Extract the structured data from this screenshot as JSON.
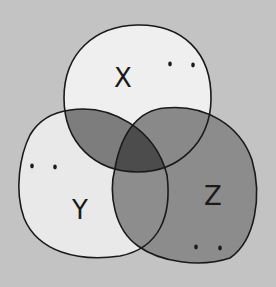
{
  "diagram": {
    "type": "venn",
    "sets": [
      {
        "id": "X",
        "label": "X",
        "region_color": "#efefef"
      },
      {
        "id": "Y",
        "label": "Y",
        "region_color": "#e9e9e9"
      },
      {
        "id": "Z",
        "label": "Z",
        "region_color": "#8c8c8c"
      }
    ],
    "intersections": {
      "X_Y": "#7d7d7d",
      "X_Z": "#898989",
      "Y_Z": "#8d8d8d",
      "X_Y_Z": "#4c4c4c"
    },
    "background": "#c3c3c3",
    "outline": "#1a1a1a"
  }
}
